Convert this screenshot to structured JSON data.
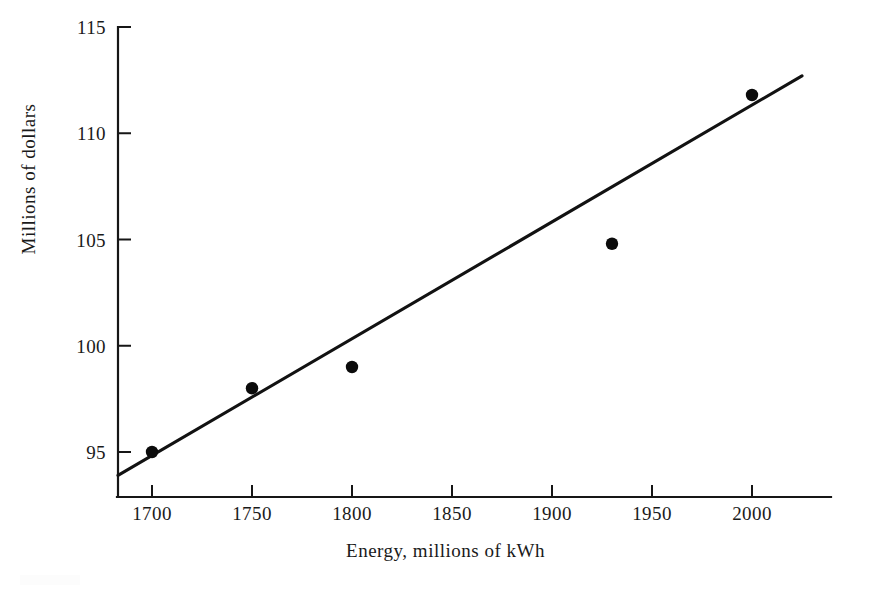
{
  "chart_data": {
    "type": "scatter",
    "title": "",
    "subtitle": "",
    "xlabel": "Energy, millions of kWh",
    "ylabel": "Millions  of  dollars",
    "xlim": [
      1675,
      2050
    ],
    "ylim": [
      92.5,
      115
    ],
    "xticks": [
      1700,
      1750,
      1800,
      1850,
      1900,
      1950,
      2000
    ],
    "xtick_labels": [
      "1700",
      "1750",
      "1800",
      "1850",
      "1900",
      "1950",
      "2000"
    ],
    "yticks": [
      95,
      100,
      105,
      110,
      115
    ],
    "ytick_labels": [
      "95",
      "100",
      "105",
      "110",
      "115"
    ],
    "grid": false,
    "legend": false,
    "legend_position": "none",
    "marker_color": "#0b0b0b",
    "line_color": "#121212",
    "axis_color": "#161616",
    "background": "#ffffff",
    "x": [
      1700,
      1750,
      1800,
      1930,
      2000
    ],
    "y": [
      95.0,
      98.0,
      99.0,
      104.8,
      111.8
    ],
    "points": [
      {
        "x": 1700,
        "y": 95.0
      },
      {
        "x": 1750,
        "y": 98.0
      },
      {
        "x": 1800,
        "y": 99.0
      },
      {
        "x": 1930,
        "y": 104.8
      },
      {
        "x": 2000,
        "y": 111.8
      }
    ],
    "series": [
      {
        "name": "Observations",
        "type": "scatter",
        "x": [
          1700,
          1750,
          1800,
          1930,
          2000
        ],
        "values": [
          95.0,
          98.0,
          99.0,
          104.8,
          111.8
        ]
      },
      {
        "name": "Fitted line",
        "type": "line",
        "x": [
          1683,
          2025
        ],
        "values": [
          93.9,
          112.7
        ]
      }
    ],
    "trend_line": {
      "x_start": 1683,
      "y_start": 93.9,
      "x_end": 2025,
      "y_end": 112.7
    },
    "annotations": []
  },
  "figure": {
    "x_axis_title": "Energy, millions of kWh",
    "y_axis_title": "Millions  of  dollars"
  }
}
